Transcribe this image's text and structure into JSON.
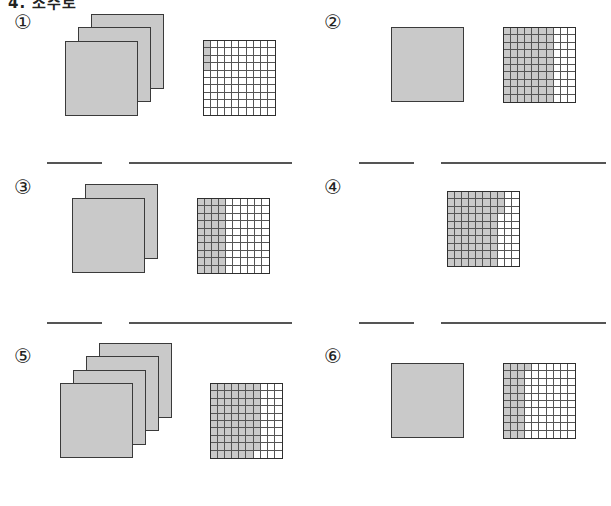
{
  "header": {
    "partial_text": "4. 소수로"
  },
  "problems": [
    {
      "label": "①",
      "full_squares": 3,
      "shaded_cells": 4,
      "fill_mode": "column"
    },
    {
      "label": "②",
      "full_squares": 1,
      "shaded_cells": 70,
      "fill_mode": "column"
    },
    {
      "label": "③",
      "full_squares": 2,
      "shaded_cells": 40,
      "fill_mode": "column"
    },
    {
      "label": "④",
      "full_squares": 0,
      "shaded_cells": 73,
      "fill_mode": "column"
    },
    {
      "label": "⑤",
      "full_squares": 4,
      "shaded_cells": 69,
      "fill_mode": "column"
    },
    {
      "label": "⑥",
      "full_squares": 1,
      "shaded_cells": 31,
      "fill_mode": "column"
    }
  ],
  "answers": [
    {
      "short": "",
      "long": ""
    },
    {
      "short": "",
      "long": ""
    },
    {
      "short": "",
      "long": ""
    },
    {
      "short": "",
      "long": ""
    }
  ],
  "colors": {
    "shade": "#c9c9c9",
    "border": "#2e2e2e"
  }
}
